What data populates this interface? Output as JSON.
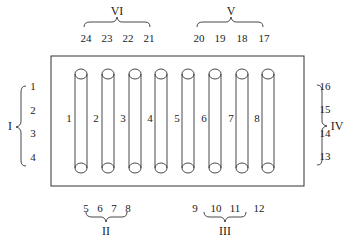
{
  "diagram": {
    "tubes": [
      {
        "label": "1",
        "x": 81
      },
      {
        "label": "2",
        "x": 108
      },
      {
        "label": "3",
        "x": 135
      },
      {
        "label": "4",
        "x": 161
      },
      {
        "label": "5",
        "x": 188
      },
      {
        "label": "6",
        "x": 215
      },
      {
        "label": "7",
        "x": 242
      },
      {
        "label": "8",
        "x": 268
      }
    ],
    "groups": {
      "I": {
        "label": "I",
        "positions": [
          "1",
          "2",
          "3",
          "4"
        ]
      },
      "II": {
        "label": "II",
        "positions": [
          "5",
          "6",
          "7",
          "8"
        ]
      },
      "III": {
        "label": "III",
        "positions": [
          "9",
          "10",
          "11",
          "12"
        ]
      },
      "IV": {
        "label": "IV",
        "positions": [
          "16",
          "15",
          "14",
          "13"
        ]
      },
      "V": {
        "label": "V",
        "positions": [
          "20",
          "19",
          "18",
          "17"
        ]
      },
      "VI": {
        "label": "VI",
        "positions": [
          "24",
          "23",
          "22",
          "21"
        ]
      }
    },
    "line_color": "#333333"
  }
}
